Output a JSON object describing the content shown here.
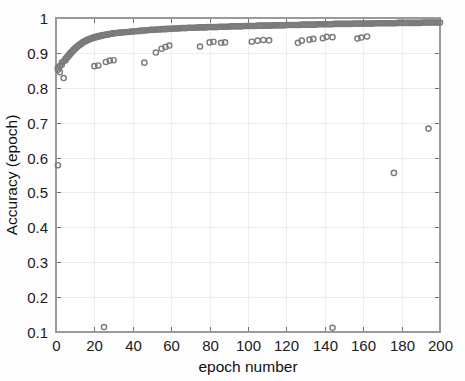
{
  "figure": {
    "background_color": "#fdfdfd",
    "plot_background_color": "#ffffff"
  },
  "chart_data": {
    "type": "scatter",
    "title": "",
    "xlabel": "epoch number",
    "ylabel": "Accuracy (epoch)",
    "xlim": [
      0,
      200
    ],
    "ylim": [
      0.1,
      1.0
    ],
    "xticks": [
      0,
      20,
      40,
      60,
      80,
      100,
      120,
      140,
      160,
      180,
      200
    ],
    "xtick_labels": [
      "0",
      "20",
      "40",
      "60",
      "80",
      "100",
      "120",
      "140",
      "160",
      "180",
      "200"
    ],
    "yticks": [
      0.1,
      0.2,
      0.3,
      0.4,
      0.5,
      0.6,
      0.7,
      0.8,
      0.9,
      1.0
    ],
    "ytick_labels": [
      "0.1",
      "0.2",
      "0.3",
      "0.4",
      "0.5",
      "0.6",
      "0.7",
      "0.8",
      "0.9",
      "1"
    ],
    "grid": true,
    "legend": null,
    "marker": {
      "shape": "circle-open",
      "color": "#7f7f7f",
      "size_px": 5.2
    },
    "series": [
      {
        "name": "Accuracy (epoch)",
        "color": "#7f7f7f",
        "points": [
          [
            1,
            0.578
          ],
          [
            1,
            0.852
          ],
          [
            1,
            0.858
          ],
          [
            2,
            0.845
          ],
          [
            2,
            0.862
          ],
          [
            3,
            0.866
          ],
          [
            3,
            0.872
          ],
          [
            4,
            0.828
          ],
          [
            4,
            0.876
          ],
          [
            5,
            0.879
          ],
          [
            5,
            0.884
          ],
          [
            6,
            0.887
          ],
          [
            6,
            0.89
          ],
          [
            7,
            0.893
          ],
          [
            7,
            0.897
          ],
          [
            8,
            0.9
          ],
          [
            8,
            0.903
          ],
          [
            9,
            0.906
          ],
          [
            9,
            0.909
          ],
          [
            10,
            0.911
          ],
          [
            10,
            0.914
          ],
          [
            11,
            0.917
          ],
          [
            11,
            0.919
          ],
          [
            12,
            0.921
          ],
          [
            12,
            0.923
          ],
          [
            13,
            0.925
          ],
          [
            13,
            0.927
          ],
          [
            14,
            0.929
          ],
          [
            14,
            0.931
          ],
          [
            15,
            0.932
          ],
          [
            15,
            0.934
          ],
          [
            16,
            0.935
          ],
          [
            16,
            0.937
          ],
          [
            17,
            0.938
          ],
          [
            17,
            0.939
          ],
          [
            18,
            0.94
          ],
          [
            18,
            0.941
          ],
          [
            19,
            0.942
          ],
          [
            19,
            0.943
          ],
          [
            20,
            0.944
          ],
          [
            20,
            0.945
          ],
          [
            21,
            0.945
          ],
          [
            21,
            0.946
          ],
          [
            22,
            0.947
          ],
          [
            22,
            0.948
          ],
          [
            23,
            0.948
          ],
          [
            23,
            0.949
          ],
          [
            24,
            0.95
          ],
          [
            24,
            0.95
          ],
          [
            25,
            0.951
          ],
          [
            25,
            0.951
          ],
          [
            26,
            0.952
          ],
          [
            26,
            0.952
          ],
          [
            27,
            0.953
          ],
          [
            27,
            0.953
          ],
          [
            28,
            0.954
          ],
          [
            28,
            0.954
          ],
          [
            29,
            0.955
          ],
          [
            29,
            0.955
          ],
          [
            30,
            0.956
          ],
          [
            30,
            0.956
          ],
          [
            31,
            0.957
          ],
          [
            32,
            0.957
          ],
          [
            33,
            0.958
          ],
          [
            34,
            0.958
          ],
          [
            35,
            0.959
          ],
          [
            36,
            0.959
          ],
          [
            37,
            0.96
          ],
          [
            38,
            0.96
          ],
          [
            39,
            0.961
          ],
          [
            40,
            0.961
          ],
          [
            41,
            0.962
          ],
          [
            42,
            0.962
          ],
          [
            43,
            0.963
          ],
          [
            44,
            0.963
          ],
          [
            45,
            0.964
          ],
          [
            46,
            0.964
          ],
          [
            47,
            0.965
          ],
          [
            48,
            0.965
          ],
          [
            49,
            0.966
          ],
          [
            50,
            0.966
          ],
          [
            51,
            0.966
          ],
          [
            52,
            0.967
          ],
          [
            53,
            0.967
          ],
          [
            54,
            0.967
          ],
          [
            55,
            0.968
          ],
          [
            56,
            0.968
          ],
          [
            57,
            0.968
          ],
          [
            58,
            0.969
          ],
          [
            59,
            0.969
          ],
          [
            60,
            0.969
          ],
          [
            61,
            0.97
          ],
          [
            62,
            0.97
          ],
          [
            63,
            0.97
          ],
          [
            64,
            0.97
          ],
          [
            65,
            0.971
          ],
          [
            66,
            0.971
          ],
          [
            67,
            0.971
          ],
          [
            68,
            0.971
          ],
          [
            69,
            0.972
          ],
          [
            70,
            0.972
          ],
          [
            71,
            0.972
          ],
          [
            72,
            0.972
          ],
          [
            73,
            0.972
          ],
          [
            74,
            0.973
          ],
          [
            75,
            0.973
          ],
          [
            76,
            0.973
          ],
          [
            77,
            0.973
          ],
          [
            78,
            0.973
          ],
          [
            79,
            0.974
          ],
          [
            80,
            0.974
          ],
          [
            81,
            0.974
          ],
          [
            82,
            0.974
          ],
          [
            83,
            0.974
          ],
          [
            84,
            0.974
          ],
          [
            85,
            0.975
          ],
          [
            86,
            0.975
          ],
          [
            87,
            0.975
          ],
          [
            88,
            0.975
          ],
          [
            89,
            0.975
          ],
          [
            90,
            0.975
          ],
          [
            91,
            0.976
          ],
          [
            92,
            0.976
          ],
          [
            93,
            0.976
          ],
          [
            94,
            0.976
          ],
          [
            95,
            0.976
          ],
          [
            96,
            0.976
          ],
          [
            97,
            0.976
          ],
          [
            98,
            0.977
          ],
          [
            99,
            0.977
          ],
          [
            100,
            0.977
          ],
          [
            101,
            0.977
          ],
          [
            102,
            0.977
          ],
          [
            103,
            0.977
          ],
          [
            104,
            0.977
          ],
          [
            105,
            0.978
          ],
          [
            106,
            0.978
          ],
          [
            107,
            0.978
          ],
          [
            108,
            0.978
          ],
          [
            109,
            0.978
          ],
          [
            110,
            0.978
          ],
          [
            111,
            0.978
          ],
          [
            112,
            0.978
          ],
          [
            113,
            0.979
          ],
          [
            114,
            0.979
          ],
          [
            115,
            0.979
          ],
          [
            116,
            0.979
          ],
          [
            117,
            0.979
          ],
          [
            118,
            0.979
          ],
          [
            119,
            0.979
          ],
          [
            120,
            0.98
          ],
          [
            121,
            0.98
          ],
          [
            122,
            0.98
          ],
          [
            123,
            0.98
          ],
          [
            124,
            0.98
          ],
          [
            125,
            0.98
          ],
          [
            126,
            0.98
          ],
          [
            127,
            0.98
          ],
          [
            128,
            0.981
          ],
          [
            129,
            0.981
          ],
          [
            130,
            0.981
          ],
          [
            131,
            0.981
          ],
          [
            132,
            0.981
          ],
          [
            133,
            0.981
          ],
          [
            134,
            0.981
          ],
          [
            135,
            0.981
          ],
          [
            136,
            0.982
          ],
          [
            137,
            0.982
          ],
          [
            138,
            0.982
          ],
          [
            139,
            0.982
          ],
          [
            140,
            0.982
          ],
          [
            141,
            0.982
          ],
          [
            142,
            0.982
          ],
          [
            143,
            0.982
          ],
          [
            144,
            0.982
          ],
          [
            145,
            0.983
          ],
          [
            146,
            0.983
          ],
          [
            147,
            0.983
          ],
          [
            148,
            0.983
          ],
          [
            149,
            0.983
          ],
          [
            150,
            0.983
          ],
          [
            151,
            0.983
          ],
          [
            152,
            0.983
          ],
          [
            153,
            0.983
          ],
          [
            154,
            0.983
          ],
          [
            155,
            0.984
          ],
          [
            156,
            0.984
          ],
          [
            157,
            0.984
          ],
          [
            158,
            0.984
          ],
          [
            159,
            0.984
          ],
          [
            160,
            0.984
          ],
          [
            161,
            0.984
          ],
          [
            162,
            0.984
          ],
          [
            163,
            0.984
          ],
          [
            164,
            0.984
          ],
          [
            165,
            0.984
          ],
          [
            166,
            0.985
          ],
          [
            167,
            0.985
          ],
          [
            168,
            0.985
          ],
          [
            169,
            0.985
          ],
          [
            170,
            0.985
          ],
          [
            171,
            0.985
          ],
          [
            172,
            0.985
          ],
          [
            173,
            0.985
          ],
          [
            174,
            0.985
          ],
          [
            175,
            0.985
          ],
          [
            176,
            0.985
          ],
          [
            177,
            0.985
          ],
          [
            178,
            0.986
          ],
          [
            179,
            0.986
          ],
          [
            180,
            0.986
          ],
          [
            181,
            0.986
          ],
          [
            182,
            0.986
          ],
          [
            183,
            0.986
          ],
          [
            184,
            0.986
          ],
          [
            185,
            0.986
          ],
          [
            186,
            0.986
          ],
          [
            187,
            0.986
          ],
          [
            188,
            0.986
          ],
          [
            189,
            0.986
          ],
          [
            190,
            0.986
          ],
          [
            191,
            0.987
          ],
          [
            192,
            0.987
          ],
          [
            193,
            0.987
          ],
          [
            194,
            0.987
          ],
          [
            195,
            0.987
          ],
          [
            196,
            0.987
          ],
          [
            197,
            0.987
          ],
          [
            198,
            0.987
          ],
          [
            199,
            0.987
          ],
          [
            200,
            0.987
          ],
          [
            20,
            0.862
          ],
          [
            22,
            0.864
          ],
          [
            26,
            0.874
          ],
          [
            28,
            0.878
          ],
          [
            30,
            0.879
          ],
          [
            46,
            0.872
          ],
          [
            52,
            0.901
          ],
          [
            55,
            0.912
          ],
          [
            57,
            0.917
          ],
          [
            59,
            0.921
          ],
          [
            75,
            0.918
          ],
          [
            80,
            0.93
          ],
          [
            82,
            0.932
          ],
          [
            86,
            0.929
          ],
          [
            88,
            0.93
          ],
          [
            102,
            0.932
          ],
          [
            105,
            0.935
          ],
          [
            108,
            0.937
          ],
          [
            111,
            0.936
          ],
          [
            126,
            0.929
          ],
          [
            128,
            0.935
          ],
          [
            132,
            0.938
          ],
          [
            134,
            0.94
          ],
          [
            139,
            0.942
          ],
          [
            141,
            0.946
          ],
          [
            144,
            0.945
          ],
          [
            157,
            0.941
          ],
          [
            159,
            0.944
          ],
          [
            162,
            0.947
          ],
          [
            25,
            0.114
          ],
          [
            144,
            0.112
          ],
          [
            176,
            0.556
          ],
          [
            194,
            0.683
          ]
        ],
        "outliers": [
          {
            "epoch": 1,
            "accuracy": 0.578
          },
          {
            "epoch": 4,
            "accuracy": 0.828
          },
          {
            "epoch": 25,
            "accuracy": 0.114
          },
          {
            "epoch": 144,
            "accuracy": 0.112
          },
          {
            "epoch": 176,
            "accuracy": 0.556
          },
          {
            "epoch": 194,
            "accuracy": 0.683
          }
        ]
      }
    ]
  }
}
